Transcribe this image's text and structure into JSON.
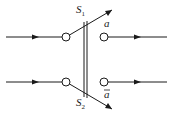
{
  "diagram": {
    "type": "double-pole switch",
    "switches": [
      {
        "label": "S",
        "subscript": "1",
        "output": "a"
      },
      {
        "label": "S",
        "subscript": "2",
        "output": "ā"
      }
    ],
    "outputs": {
      "top": "a",
      "bottom": "a",
      "bottom_overbar": true
    },
    "colors": {
      "line": "#1a1a1a",
      "background": "#ffffff"
    }
  }
}
